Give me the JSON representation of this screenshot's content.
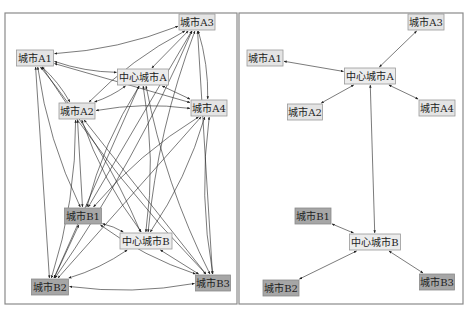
{
  "diagram": {
    "panels": [
      {
        "name": "left-panel-full-network",
        "description": "Fully connected network",
        "nodes": [
          {
            "id": "A3",
            "label": "城市A3",
            "x": 197,
            "y": 22,
            "w": 36,
            "style": "light"
          },
          {
            "id": "A1",
            "label": "城市A1",
            "x": 35,
            "y": 58,
            "w": 37,
            "style": "light"
          },
          {
            "id": "CA",
            "label": "中心城市A",
            "x": 143,
            "y": 77,
            "w": 51,
            "style": "center"
          },
          {
            "id": "A2",
            "label": "城市A2",
            "x": 77,
            "y": 111,
            "w": 36,
            "style": "light"
          },
          {
            "id": "A4",
            "label": "城市A4",
            "x": 209,
            "y": 108,
            "w": 36,
            "style": "light"
          },
          {
            "id": "B1",
            "label": "城市B1",
            "x": 83,
            "y": 216,
            "w": 37,
            "style": "dark"
          },
          {
            "id": "CB",
            "label": "中心城市B",
            "x": 146,
            "y": 241,
            "w": 52,
            "style": "center"
          },
          {
            "id": "B2",
            "label": "城市B2",
            "x": 50,
            "y": 287,
            "w": 37,
            "style": "dark"
          },
          {
            "id": "B3",
            "label": "城市B3",
            "x": 213,
            "y": 283,
            "w": 35,
            "style": "dark"
          }
        ],
        "edges": "all-pairs-bidirectional"
      },
      {
        "name": "right-panel-hub-network",
        "description": "Hub-and-spoke network",
        "nodes": [
          {
            "id": "A3",
            "label": "城市A3",
            "x": 426,
            "y": 22,
            "w": 36,
            "style": "light"
          },
          {
            "id": "A1",
            "label": "城市A1",
            "x": 265,
            "y": 58,
            "w": 36,
            "style": "light"
          },
          {
            "id": "CA",
            "label": "中心城市A",
            "x": 370,
            "y": 76,
            "w": 51,
            "style": "center"
          },
          {
            "id": "A2",
            "label": "城市A2",
            "x": 305,
            "y": 112,
            "w": 35,
            "style": "light"
          },
          {
            "id": "A4",
            "label": "城市A4",
            "x": 437,
            "y": 108,
            "w": 36,
            "style": "light"
          },
          {
            "id": "B1",
            "label": "城市B1",
            "x": 313,
            "y": 216,
            "w": 36,
            "style": "dark"
          },
          {
            "id": "CB",
            "label": "中心城市B",
            "x": 375,
            "y": 242,
            "w": 51,
            "style": "center"
          },
          {
            "id": "B2",
            "label": "城市B2",
            "x": 281,
            "y": 288,
            "w": 36,
            "style": "dark"
          },
          {
            "id": "B3",
            "label": "城市B3",
            "x": 437,
            "y": 282,
            "w": 35,
            "style": "dark"
          }
        ],
        "edges": [
          [
            "CA",
            "A1"
          ],
          [
            "CA",
            "A2"
          ],
          [
            "CA",
            "A3"
          ],
          [
            "CA",
            "A4"
          ],
          [
            "CA",
            "CB"
          ],
          [
            "CB",
            "B1"
          ],
          [
            "CB",
            "B2"
          ],
          [
            "CB",
            "B3"
          ]
        ]
      }
    ],
    "colors": {
      "light_node": "#e4e4e4",
      "dark_node": "#a6a6a6",
      "center_node": "#ececec",
      "edge": "#222222",
      "frame": "#8a8a8a"
    }
  }
}
